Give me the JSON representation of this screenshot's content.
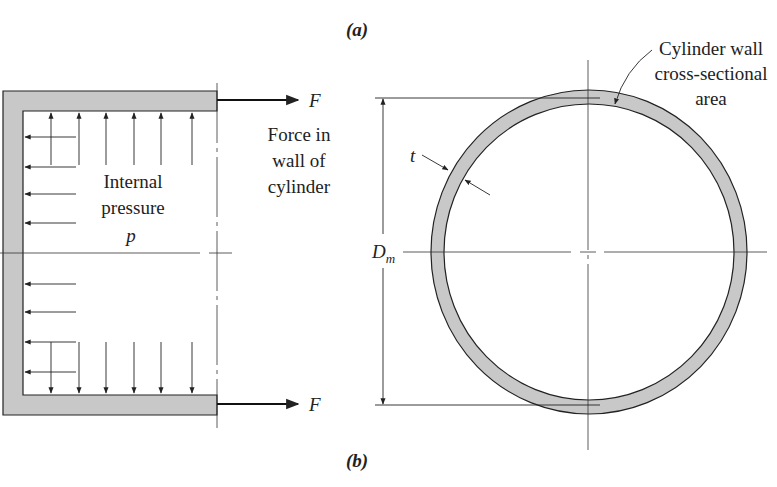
{
  "figure": {
    "label_a": "(a)",
    "label_b": "(b)"
  },
  "left_diagram": {
    "force_top": "F",
    "force_bottom": "F",
    "force_caption": [
      "Force in",
      "wall of",
      "cylinder"
    ],
    "pressure_caption": [
      "Internal",
      "pressure"
    ],
    "pressure_symbol": "p"
  },
  "right_diagram": {
    "wall_caption": [
      "Cylinder wall",
      "cross-sectional",
      "area"
    ],
    "thickness_symbol": "t",
    "diameter_symbol": "D",
    "diameter_subscript": "m"
  },
  "colors": {
    "wall_fill": "#c8c8c8",
    "stroke": "#222222"
  }
}
